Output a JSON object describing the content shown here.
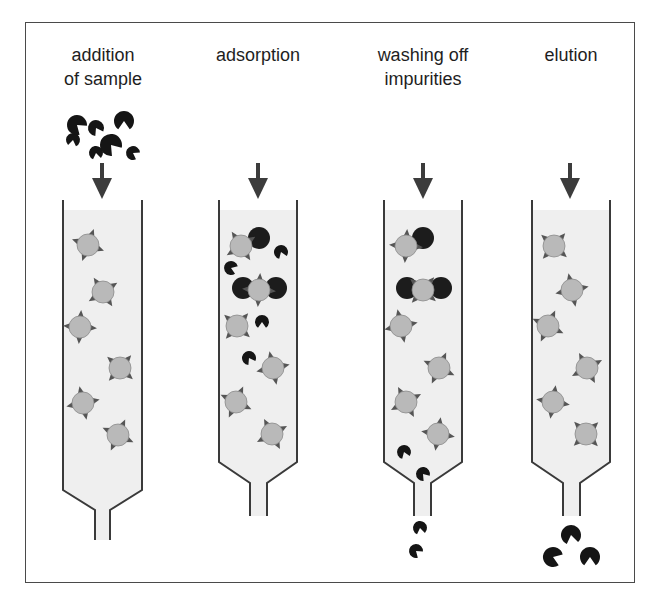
{
  "diagram": {
    "colors": {
      "frame": "#4a4a4a",
      "tube_wall": "#3a3a3a",
      "tube_fill": "#efefef",
      "bead_fill": "#b9b9b9",
      "bead_spike": "#555555",
      "particle": "#151515",
      "arrow": "#3c3c3c",
      "text": "#1e1e1e"
    },
    "steps": [
      {
        "id": "addition",
        "label_lines": [
          "addition",
          "of sample"
        ],
        "label_center_x": 103,
        "tube": {
          "left": 63,
          "right": 142,
          "top": 200,
          "taper_y": 490,
          "neck_left": 95,
          "neck_right": 110,
          "neck_top": 510,
          "bottom": 540
        },
        "arrow_x": 102,
        "beads": [
          [
            88,
            245
          ],
          [
            103,
            292
          ],
          [
            80,
            327
          ],
          [
            120,
            368
          ],
          [
            83,
            403
          ],
          [
            118,
            435
          ]
        ],
        "targets": [],
        "impurities": [
          [
            96,
            128,
            8,
            0
          ],
          [
            73,
            140,
            7,
            40
          ],
          [
            96,
            153,
            7,
            20
          ],
          [
            133,
            153,
            7,
            -30
          ]
        ],
        "targets_free": [
          [
            77,
            125,
            10,
            -20
          ],
          [
            124,
            121,
            10,
            30
          ],
          [
            111,
            145,
            11,
            -10
          ]
        ]
      },
      {
        "id": "adsorption",
        "label_lines": [
          "adsorption"
        ],
        "label_center_x": 258,
        "tube": {
          "left": 219,
          "right": 297,
          "top": 200,
          "taper_y": 462,
          "neck_left": 250,
          "neck_right": 267,
          "neck_top": 483,
          "bottom": 516
        },
        "arrow_x": 258,
        "beads": [
          [
            241,
            246
          ],
          [
            259,
            290
          ],
          [
            237,
            326
          ],
          [
            273,
            368
          ],
          [
            236,
            402
          ],
          [
            272,
            434
          ]
        ],
        "targets": [
          [
            259,
            238
          ],
          [
            243,
            288
          ],
          [
            276,
            288
          ]
        ],
        "impurities": [
          [
            281,
            252,
            7,
            10
          ],
          [
            231,
            268,
            7,
            -40
          ],
          [
            262,
            322,
            7,
            30
          ],
          [
            249,
            358,
            7,
            0
          ]
        ],
        "targets_free": []
      },
      {
        "id": "washing",
        "label_lines": [
          "washing off",
          "impurities"
        ],
        "label_center_x": 423,
        "tube": {
          "left": 384,
          "right": 462,
          "top": 200,
          "taper_y": 462,
          "neck_left": 414,
          "neck_right": 431,
          "neck_top": 483,
          "bottom": 516
        },
        "arrow_x": 423,
        "beads": [
          [
            406,
            246
          ],
          [
            423,
            290
          ],
          [
            401,
            326
          ],
          [
            439,
            368
          ],
          [
            406,
            402
          ],
          [
            438,
            434
          ]
        ],
        "targets": [
          [
            423,
            238
          ],
          [
            407,
            288
          ],
          [
            441,
            288
          ]
        ],
        "impurities": [
          [
            404,
            452,
            7,
            10
          ],
          [
            423,
            474,
            7,
            -10
          ],
          [
            420,
            528,
            7,
            20
          ],
          [
            416,
            551,
            7,
            -20
          ]
        ],
        "targets_free": []
      },
      {
        "id": "elution",
        "label_lines": [
          "elution"
        ],
        "label_center_x": 571,
        "tube": {
          "left": 532,
          "right": 610,
          "top": 200,
          "taper_y": 462,
          "neck_left": 563,
          "neck_right": 580,
          "neck_top": 483,
          "bottom": 516
        },
        "arrow_x": 570,
        "beads": [
          [
            554,
            246
          ],
          [
            572,
            290
          ],
          [
            548,
            326
          ],
          [
            587,
            368
          ],
          [
            553,
            402
          ],
          [
            586,
            434
          ]
        ],
        "targets": [],
        "impurities": [],
        "targets_free": [
          [
            571,
            535,
            10,
            20
          ],
          [
            553,
            557,
            10,
            -40
          ],
          [
            590,
            557,
            10,
            30
          ]
        ]
      }
    ]
  }
}
